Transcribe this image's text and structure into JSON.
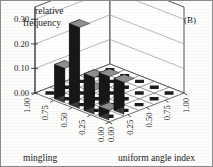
{
  "panel_label": "(B)",
  "chart_data": {
    "type": "bar",
    "title": "",
    "zlabel_line1": "relative",
    "zlabel_line2": "frequency",
    "xlabel": "mingling",
    "ylabel": "uniform angle index",
    "zlim": [
      0.0,
      0.35
    ],
    "zticks": [
      "0.00",
      "0.10",
      "0.20",
      "0.30"
    ],
    "ztick_values": [
      0.0,
      0.1,
      0.2,
      0.3
    ],
    "xticks": [
      "1.00",
      "0.75",
      "0.50",
      "0.25",
      "0.00"
    ],
    "xtick_values": [
      1.0,
      0.75,
      0.5,
      0.25,
      0.0
    ],
    "yticks": [
      "0.00",
      "0.25",
      "0.50",
      "0.75",
      "1.00"
    ],
    "ytick_values": [
      0.0,
      0.25,
      0.5,
      0.75,
      1.0
    ],
    "grid": true,
    "legend": "none",
    "categories_x": [
      "1.00",
      "0.75",
      "0.50",
      "0.25",
      "0.00"
    ],
    "categories_y": [
      "0.00",
      "0.25",
      "0.50",
      "0.75",
      "1.00"
    ],
    "bars": [
      {
        "x_index": 0,
        "y_index": 0,
        "x": "1.00",
        "y": "0.00",
        "value": 0.0
      },
      {
        "x_index": 0,
        "y_index": 1,
        "x": "1.00",
        "y": "0.25",
        "value": 0.0
      },
      {
        "x_index": 0,
        "y_index": 2,
        "x": "1.00",
        "y": "0.50",
        "value": 0.0
      },
      {
        "x_index": 0,
        "y_index": 3,
        "x": "1.00",
        "y": "0.75",
        "value": 0.0
      },
      {
        "x_index": 0,
        "y_index": 4,
        "x": "1.00",
        "y": "1.00",
        "value": 0.0
      },
      {
        "x_index": 1,
        "y_index": 0,
        "x": "0.75",
        "y": "0.00",
        "value": 0.14
      },
      {
        "x_index": 1,
        "y_index": 1,
        "x": "0.75",
        "y": "0.25",
        "value": 0.0
      },
      {
        "x_index": 1,
        "y_index": 2,
        "x": "0.75",
        "y": "0.50",
        "value": 0.0
      },
      {
        "x_index": 1,
        "y_index": 3,
        "x": "0.75",
        "y": "0.75",
        "value": 0.0
      },
      {
        "x_index": 1,
        "y_index": 4,
        "x": "0.75",
        "y": "1.00",
        "value": 0.0
      },
      {
        "x_index": 2,
        "y_index": 0,
        "x": "0.50",
        "y": "0.00",
        "value": 0.33
      },
      {
        "x_index": 2,
        "y_index": 1,
        "x": "0.50",
        "y": "0.25",
        "value": 0.05
      },
      {
        "x_index": 2,
        "y_index": 2,
        "x": "0.50",
        "y": "0.50",
        "value": 0.0
      },
      {
        "x_index": 2,
        "y_index": 3,
        "x": "0.50",
        "y": "0.75",
        "value": 0.0
      },
      {
        "x_index": 2,
        "y_index": 4,
        "x": "0.50",
        "y": "1.00",
        "value": 0.0
      },
      {
        "x_index": 3,
        "y_index": 0,
        "x": "0.25",
        "y": "0.00",
        "value": 0.15
      },
      {
        "x_index": 3,
        "y_index": 1,
        "x": "0.25",
        "y": "0.25",
        "value": 0.13
      },
      {
        "x_index": 3,
        "y_index": 2,
        "x": "0.25",
        "y": "0.50",
        "value": 0.0
      },
      {
        "x_index": 3,
        "y_index": 3,
        "x": "0.25",
        "y": "0.75",
        "value": 0.0
      },
      {
        "x_index": 3,
        "y_index": 4,
        "x": "0.25",
        "y": "1.00",
        "value": 0.0
      },
      {
        "x_index": 4,
        "y_index": 0,
        "x": "0.00",
        "y": "0.00",
        "value": 0.04
      },
      {
        "x_index": 4,
        "y_index": 1,
        "x": "0.00",
        "y": "0.25",
        "value": 0.13
      },
      {
        "x_index": 4,
        "y_index": 2,
        "x": "0.00",
        "y": "0.50",
        "value": 0.0
      },
      {
        "x_index": 4,
        "y_index": 3,
        "x": "0.00",
        "y": "0.75",
        "value": 0.0
      },
      {
        "x_index": 4,
        "y_index": 4,
        "x": "0.00",
        "y": "1.00",
        "value": 0.0
      }
    ],
    "colors": {
      "bar_top": "#8f8f8f",
      "bar_left": "#3a3a3a",
      "bar_right": "#171717",
      "floor_cell": "#1c1c1c",
      "grid": "#9a9a9a",
      "axis": "#2a2a2a"
    }
  }
}
